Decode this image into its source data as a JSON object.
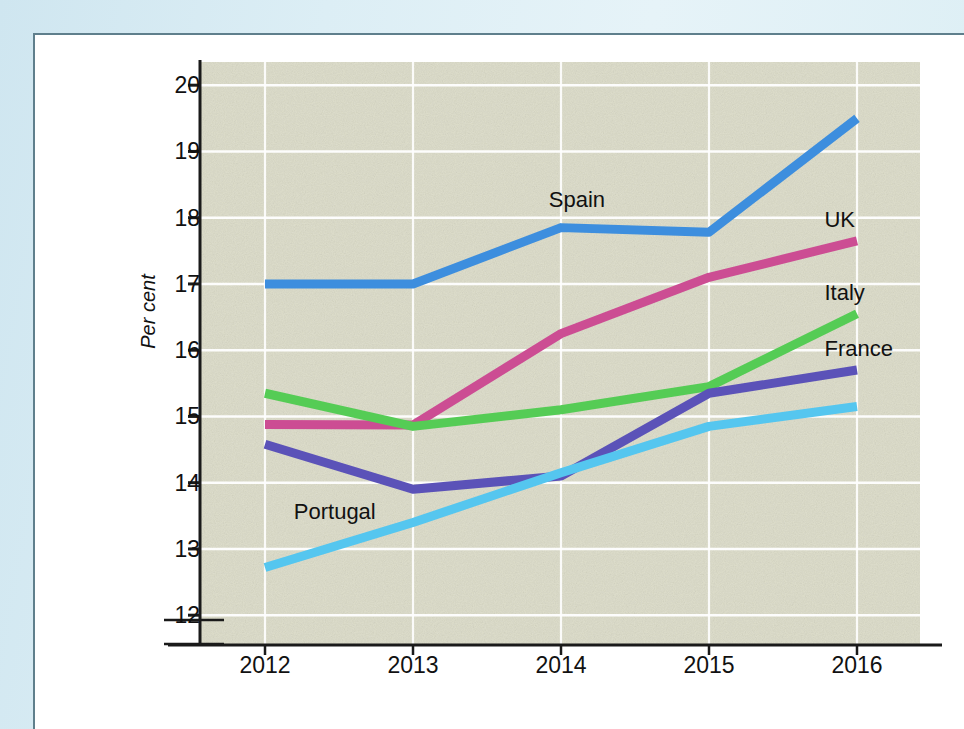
{
  "chart_data": {
    "type": "line",
    "title": "",
    "subtitle": "",
    "xlabel": "",
    "ylabel": "Per cent",
    "x": [
      2012,
      2013,
      2014,
      2015,
      2016
    ],
    "categories": [
      "2012",
      "2013",
      "2014",
      "2015",
      "2016"
    ],
    "ylim": [
      11.6,
      20.3
    ],
    "yticks": [
      12,
      13,
      14,
      15,
      16,
      17,
      18,
      19,
      20
    ],
    "ytick_labels": [
      "12",
      "13",
      "14",
      "15",
      "16",
      "17",
      "18",
      "19",
      "20"
    ],
    "xticks": [
      2012,
      2013,
      2014,
      2015,
      2016
    ],
    "xtick_labels": [
      "2012",
      "2013",
      "2014",
      "2015",
      "2016"
    ],
    "grid": true,
    "grid_color": "#ffffff",
    "plot_background": "#dcdcc8",
    "axis_break": true,
    "legend_position": "inline-labels",
    "series": [
      {
        "name": "Spain",
        "color": "#3d8ede",
        "values": [
          17.0,
          17.0,
          17.85,
          17.78,
          19.5
        ],
        "label_x": 2014,
        "label_y": 18.25
      },
      {
        "name": "UK",
        "color": "#cc4d93",
        "values": [
          14.88,
          14.87,
          16.25,
          17.1,
          17.65
        ],
        "label_x": 2016,
        "label_y": 17.95
      },
      {
        "name": "Italy",
        "color": "#55cc55",
        "values": [
          15.35,
          14.85,
          15.1,
          15.45,
          16.55
        ],
        "label_x": 2016,
        "label_y": 16.85
      },
      {
        "name": "France",
        "color": "#5b52b8",
        "values": [
          14.58,
          13.9,
          14.1,
          15.35,
          15.7
        ],
        "label_x": 2016,
        "label_y": 16.0
      },
      {
        "name": "Portugal",
        "color": "#55c6ef",
        "values": [
          12.72,
          13.4,
          14.15,
          14.85,
          15.15
        ],
        "label_x": 2012.6,
        "label_y": 13.55
      }
    ]
  },
  "axis": {
    "y_title": "Per cent"
  }
}
